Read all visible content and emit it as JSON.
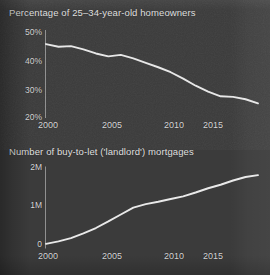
{
  "figure": {
    "background_color": "#3b3b3b",
    "line_color": "#e8e8e8",
    "axis_color": "#8f8f8f",
    "text_color": "#dcdcdc"
  },
  "charts": [
    {
      "title": "Percentage of 25–34-year-old homeowners",
      "y_ticks": [
        "50%",
        "40%",
        "30%",
        "20%"
      ],
      "x_ticks": [
        "2000",
        "2005",
        "2010",
        "2015"
      ]
    },
    {
      "title": "Number of buy-to-let ('landlord') mortgages",
      "y_ticks": [
        "2M",
        "1M",
        "0"
      ],
      "x_ticks": [
        "2000",
        "2005",
        "2010",
        "2015"
      ]
    }
  ],
  "chart_data": [
    {
      "type": "line",
      "title": "Percentage of 25–34-year-old homeowners",
      "xlabel": "",
      "ylabel": "",
      "xlim": [
        2000,
        2017
      ],
      "ylim": [
        20,
        50
      ],
      "x_ticks": [
        2000,
        2005,
        2010,
        2015
      ],
      "x_tick_labels": [
        "2000",
        "2005",
        "2010",
        "2015"
      ],
      "y_ticks": [
        20,
        30,
        40,
        50
      ],
      "y_tick_labels": [
        "20%",
        "30%",
        "40%",
        "50%"
      ],
      "grid": false,
      "legend": "none",
      "x": [
        2000,
        2001,
        2002,
        2003,
        2004,
        2005,
        2006,
        2007,
        2008,
        2009,
        2010,
        2011,
        2012,
        2013,
        2014,
        2015,
        2016,
        2017
      ],
      "values": [
        45.2,
        44.3,
        44.5,
        43.4,
        42.0,
        41.0,
        41.5,
        40.3,
        38.8,
        37.3,
        35.6,
        33.4,
        31.0,
        29.0,
        27.4,
        27.2,
        26.4,
        25.0
      ]
    },
    {
      "type": "line",
      "title": "Number of buy-to-let ('landlord') mortgages",
      "xlabel": "",
      "ylabel": "",
      "xlim": [
        2000,
        2017
      ],
      "ylim": [
        0,
        2200000
      ],
      "x_ticks": [
        2000,
        2005,
        2010,
        2015
      ],
      "x_tick_labels": [
        "2000",
        "2005",
        "2010",
        "2015"
      ],
      "y_ticks": [
        0,
        1000000,
        2000000
      ],
      "y_tick_labels": [
        "0",
        "1M",
        "2M"
      ],
      "grid": false,
      "legend": "none",
      "x": [
        2000,
        2001,
        2002,
        2003,
        2004,
        2005,
        2006,
        2007,
        2008,
        2009,
        2010,
        2011,
        2012,
        2013,
        2014,
        2015,
        2016,
        2017
      ],
      "values": [
        120000,
        185000,
        270000,
        390000,
        530000,
        700000,
        880000,
        1060000,
        1150000,
        1210000,
        1280000,
        1350000,
        1450000,
        1560000,
        1650000,
        1760000,
        1850000,
        1900000
      ]
    }
  ]
}
